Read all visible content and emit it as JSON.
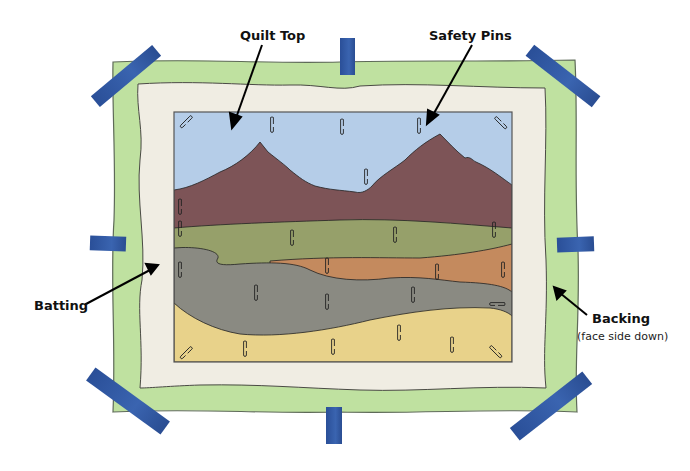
{
  "diagram": {
    "labels": {
      "quilt_top": "Quilt Top",
      "safety_pins": "Safety Pins",
      "batting": "Batting",
      "backing": "Backing",
      "backing_note": "(face side down)"
    },
    "layers": [
      {
        "name": "Backing",
        "color": "#bfe1a0"
      },
      {
        "name": "Batting",
        "color": "#f0ede3"
      },
      {
        "name": "Quilt Top",
        "color": "#b5cde8"
      }
    ],
    "quilt_top_bands": [
      {
        "name": "sky",
        "color": "#b5cde8"
      },
      {
        "name": "mountains",
        "color": "#7d5457"
      },
      {
        "name": "green-field",
        "color": "#96a06a"
      },
      {
        "name": "orange-field",
        "color": "#c48a5e"
      },
      {
        "name": "gray-field",
        "color": "#8a8a82"
      },
      {
        "name": "yellow-field",
        "color": "#e8d28a"
      }
    ],
    "tape_color": "#2e57a4",
    "tape_count": 8,
    "safety_pin_count": 31
  }
}
